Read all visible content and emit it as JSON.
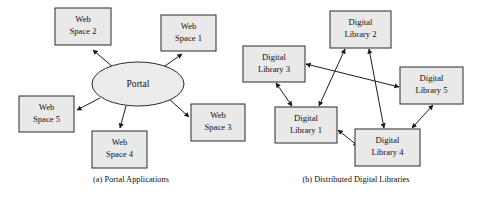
{
  "figure": {
    "width": 483,
    "height": 199,
    "background": "#ffffff",
    "box_fill": "#e9e9e9",
    "box_stroke": "#2b2b2b",
    "edge_color": "#1c1c1c",
    "text_color": "#111111"
  },
  "panel_a": {
    "caption": "(a) Portal Applications",
    "caption_x": 131,
    "caption_y": 180,
    "hub": {
      "name": "portal",
      "label": "Portal",
      "shape": "ellipse",
      "cx": 138,
      "cy": 84,
      "rx": 46,
      "ry": 22
    },
    "nodes": [
      {
        "name": "web-space-2",
        "line1": "Web",
        "line2": "Space 2",
        "x": 55,
        "y": 8,
        "w": 56,
        "h": 37
      },
      {
        "name": "web-space-1",
        "line1": "Web",
        "line2": "Space 1",
        "x": 161,
        "y": 15,
        "w": 55,
        "h": 36
      },
      {
        "name": "web-space-3",
        "line1": "Web",
        "line2": "Space 3",
        "x": 191,
        "y": 104,
        "w": 54,
        "h": 37
      },
      {
        "name": "web-space-4",
        "line1": "Web",
        "line2": "Space 4",
        "x": 92,
        "y": 131,
        "w": 55,
        "h": 37
      },
      {
        "name": "web-space-5",
        "line1": "Web",
        "line2": "Space 5",
        "x": 19,
        "y": 96,
        "w": 55,
        "h": 36
      }
    ],
    "edges": [
      {
        "name": "portal-to-web-space-2",
        "from": "portal",
        "to": "web-space-2",
        "arrow": "single",
        "x1": 114,
        "y1": 68,
        "x2": 93,
        "y2": 50
      },
      {
        "name": "portal-to-web-space-1",
        "from": "portal",
        "to": "web-space-1",
        "arrow": "single",
        "x1": 162,
        "y1": 68,
        "x2": 182,
        "y2": 54
      },
      {
        "name": "portal-to-web-space-3",
        "from": "portal",
        "to": "web-space-3",
        "arrow": "single",
        "x1": 169,
        "y1": 99,
        "x2": 189,
        "y2": 117
      },
      {
        "name": "portal-to-web-space-4",
        "from": "portal",
        "to": "web-space-4",
        "arrow": "single",
        "x1": 126,
        "y1": 106,
        "x2": 120,
        "y2": 128
      },
      {
        "name": "portal-to-web-space-5",
        "from": "portal",
        "to": "web-space-5",
        "arrow": "single",
        "x1": 100,
        "y1": 98,
        "x2": 77,
        "y2": 110
      }
    ]
  },
  "panel_b": {
    "caption": "(b) Distributed Digital Libraries",
    "caption_x": 356,
    "caption_y": 180,
    "nodes": [
      {
        "name": "digital-library-2",
        "line1": "Digital",
        "line2": "Library 2",
        "x": 330,
        "y": 11,
        "w": 61,
        "h": 37
      },
      {
        "name": "digital-library-3",
        "line1": "Digital",
        "line2": "Library 3",
        "x": 243,
        "y": 46,
        "w": 62,
        "h": 36
      },
      {
        "name": "digital-library-5",
        "line1": "Digital",
        "line2": "Library 5",
        "x": 400,
        "y": 67,
        "w": 63,
        "h": 37
      },
      {
        "name": "digital-library-1",
        "line1": "Digital",
        "line2": "Library 1",
        "x": 275,
        "y": 107,
        "w": 62,
        "h": 36
      },
      {
        "name": "digital-library-4",
        "line1": "Digital",
        "line2": "Library 4",
        "x": 355,
        "y": 129,
        "w": 65,
        "h": 37
      }
    ],
    "edges": [
      {
        "name": "dl3-dl5",
        "from": "digital-library-3",
        "to": "digital-library-5",
        "arrow": "double",
        "x1": 306,
        "y1": 64,
        "x2": 399,
        "y2": 87
      },
      {
        "name": "dl3-dl1",
        "from": "digital-library-3",
        "to": "digital-library-1",
        "arrow": "double",
        "x1": 276,
        "y1": 83,
        "x2": 292,
        "y2": 106
      },
      {
        "name": "dl1-dl2",
        "from": "digital-library-1",
        "to": "digital-library-2",
        "arrow": "double",
        "x1": 319,
        "y1": 106,
        "x2": 345,
        "y2": 49
      },
      {
        "name": "dl2-dl4",
        "from": "digital-library-2",
        "to": "digital-library-4",
        "arrow": "double",
        "x1": 369,
        "y1": 49,
        "x2": 384,
        "y2": 128
      },
      {
        "name": "dl1-dl4",
        "from": "digital-library-1",
        "to": "digital-library-4",
        "arrow": "double",
        "x1": 338,
        "y1": 130,
        "x2": 358,
        "y2": 146
      },
      {
        "name": "dl4-dl5",
        "from": "digital-library-4",
        "to": "digital-library-5",
        "arrow": "double",
        "x1": 412,
        "y1": 128,
        "x2": 433,
        "y2": 105
      }
    ]
  }
}
